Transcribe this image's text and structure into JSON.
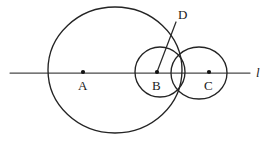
{
  "figure": {
    "width": 272,
    "height": 143,
    "background": "#ffffff",
    "stroke_color": "#242424",
    "line_color": "#4a4a4a",
    "dot_color": "#111111"
  },
  "line": {
    "name": "l",
    "label": "l",
    "label_x": 256,
    "label_y": 66,
    "x1": 10,
    "y1": 73,
    "x2": 250,
    "y2": 73
  },
  "circles": [
    {
      "id": "circle-a",
      "center_label": "A",
      "cx": 115,
      "cy": 70,
      "rx": 67,
      "ry": 63
    },
    {
      "id": "circle-b",
      "center_label": "B",
      "cx": 160,
      "cy": 72,
      "rx": 25,
      "ry": 25
    },
    {
      "id": "circle-c",
      "center_label": "C",
      "cx": 199,
      "cy": 73,
      "rx": 28,
      "ry": 26
    }
  ],
  "points": [
    {
      "id": "point-a",
      "label": "A",
      "x": 83,
      "y": 72,
      "label_x": 78,
      "label_y": 79,
      "dot": true
    },
    {
      "id": "point-b",
      "label": "B",
      "x": 157,
      "y": 72,
      "label_x": 152,
      "label_y": 79,
      "dot": true
    },
    {
      "id": "point-c",
      "label": "C",
      "x": 209,
      "y": 72,
      "label_x": 204,
      "label_y": 79,
      "dot": true
    },
    {
      "id": "point-d",
      "label": "D",
      "x": 176,
      "y": 22,
      "label_x": 178,
      "label_y": 8,
      "dot": false
    }
  ],
  "segments": [
    {
      "id": "segment-bd",
      "from": "B",
      "to": "D",
      "x1": 157,
      "y1": 72,
      "x2": 176,
      "y2": 22
    }
  ]
}
